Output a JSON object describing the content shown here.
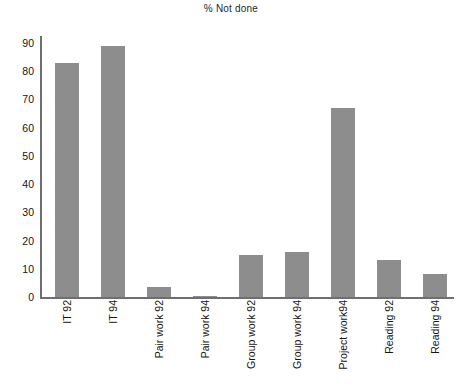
{
  "chart_data": {
    "type": "bar",
    "title": "% Not done",
    "xlabel": "",
    "ylabel": "",
    "ylim": [
      0,
      90
    ],
    "ytick_labels": [
      "90",
      "80",
      "70",
      "60",
      "50",
      "40",
      "30",
      "20",
      "10",
      "0"
    ],
    "yticks": [
      90,
      80,
      70,
      60,
      50,
      40,
      30,
      20,
      10,
      0
    ],
    "grid": false,
    "legend": "none",
    "bar_color": "#8d8d8d",
    "axis_color": "#6f6f6f",
    "categories": [
      "IT 92",
      "IT 94",
      "Pair work 92",
      "Pair work 94",
      "Group work 92",
      "Group work 94",
      "Project  work94",
      "Reading 92",
      "Reading 94"
    ],
    "values": [
      83,
      89,
      3.5,
      0.5,
      15,
      16,
      67,
      13,
      8
    ]
  }
}
